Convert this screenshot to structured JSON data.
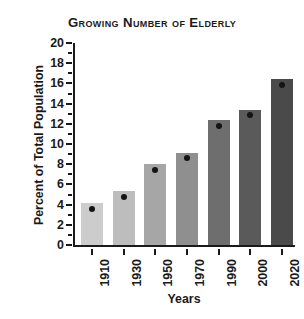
{
  "chart_data": {
    "type": "bar",
    "title": "Growing Number of Elderly",
    "xlabel": "Years",
    "ylabel": "Percent of Total Population",
    "categories": [
      "1910",
      "1930",
      "1950",
      "1970",
      "1990",
      "2000",
      "2020"
    ],
    "values": [
      4.2,
      5.3,
      8.0,
      9.1,
      12.4,
      13.4,
      16.4
    ],
    "marker_values": [
      3.6,
      4.8,
      7.4,
      8.6,
      11.8,
      12.9,
      15.8
    ],
    "bar_colors": [
      "#cccccc",
      "#bdbdbd",
      "#a6a6a6",
      "#8f8f8f",
      "#6e6e6e",
      "#5a5a5a",
      "#4a4a4a"
    ],
    "ylim": [
      0,
      20
    ],
    "y_major_ticks": [
      0,
      2,
      4,
      6,
      8,
      10,
      12,
      14,
      16,
      18,
      20
    ],
    "y_minor_ticks": [
      1,
      3,
      5,
      7,
      9,
      11,
      13,
      15,
      17,
      19
    ],
    "y_tick_labels": [
      "0",
      "2",
      "4",
      "6",
      "8",
      "10",
      "12",
      "14",
      "16",
      "18",
      "20"
    ],
    "grid": false,
    "legend": "none"
  }
}
